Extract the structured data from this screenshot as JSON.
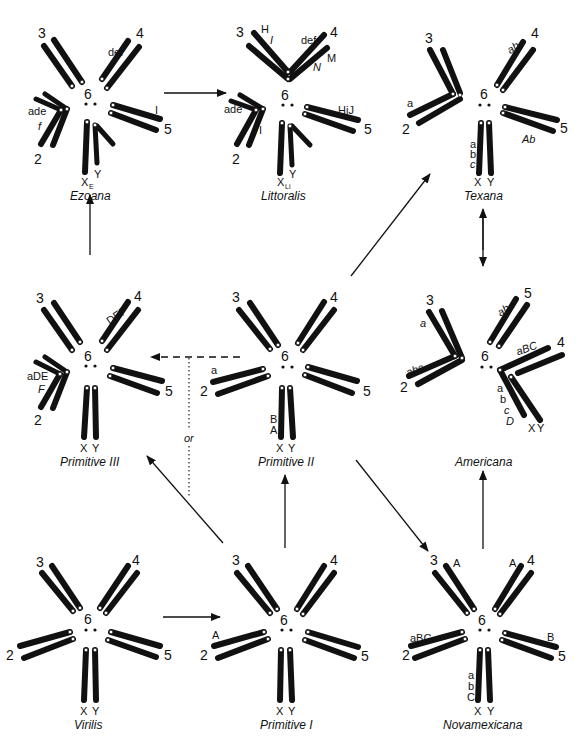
{
  "figure": {
    "type": "chromosome-karyotype-phylogeny",
    "chromosome_numbers": [
      "2",
      "3",
      "4",
      "5",
      "6"
    ],
    "sex_chromosomes": [
      "X",
      "Y"
    ],
    "or_label": "or"
  },
  "species": [
    {
      "id": "ezoana",
      "name": "Ezoana",
      "x_label": "X",
      "x_subscript": "E",
      "y_label": "Y",
      "labels": {
        "chr4": "def",
        "chr2": "ade",
        "chr2_italic": "f",
        "chr5": "I"
      }
    },
    {
      "id": "littoralis",
      "name": "Littoralis",
      "x_label": "X",
      "x_subscript": "Li",
      "y_label": "Y",
      "labels": {
        "chr3": "H",
        "chr3_italic": "I",
        "chr4": "def",
        "chr4_italic": "N",
        "chr4_upper": "M",
        "chr2": "ade",
        "chr2_inner": "I",
        "chr5": "HiJ"
      }
    },
    {
      "id": "texana",
      "name": "Texana",
      "x_label": "X",
      "y_label": "Y",
      "labels": {
        "chr4": "ab",
        "chr2": "a",
        "chr5": "Ab",
        "chrX": [
          "a",
          "b",
          "c"
        ]
      }
    },
    {
      "id": "primitive-iii",
      "name": "Primitive III",
      "x_label": "X",
      "y_label": "Y",
      "labels": {
        "chr4": "DEF",
        "chr2": "aDE",
        "chr2_italic": "F"
      }
    },
    {
      "id": "primitive-ii",
      "name": "Primitive II",
      "x_label": "X",
      "y_label": "Y",
      "labels": {
        "chr2": "a",
        "chrX": [
          "B",
          "A"
        ]
      }
    },
    {
      "id": "americana",
      "name": "Americana",
      "x_label": "X",
      "y_label": "Y",
      "labels": {
        "chr3": "a",
        "chr2": "abc",
        "chr5": "ab",
        "chr4": "aBC",
        "chrX": [
          "a",
          "b",
          "c",
          "D"
        ]
      }
    },
    {
      "id": "virilis",
      "name": "Virilis",
      "x_label": "X",
      "y_label": "Y",
      "labels": {}
    },
    {
      "id": "primitive-i",
      "name": "Primitive I",
      "x_label": "X",
      "y_label": "Y",
      "labels": {
        "chr2": "A"
      }
    },
    {
      "id": "novamexicana",
      "name": "Novamexicana",
      "x_label": "X",
      "y_label": "Y",
      "labels": {
        "chr3": "A",
        "chr4": "A",
        "chr2": "aBC",
        "chr5": "B",
        "chrX": [
          "a",
          "b",
          "C"
        ]
      }
    }
  ],
  "edges": [
    {
      "from": "Virilis",
      "to": "Primitive I",
      "style": "solid"
    },
    {
      "from": "Primitive I",
      "to": "Primitive II",
      "style": "solid"
    },
    {
      "from": "Primitive I",
      "to": "Primitive III",
      "style": "solid"
    },
    {
      "from": "Primitive II",
      "to": "Primitive III",
      "style": "dashed",
      "note": "or"
    },
    {
      "from": "Primitive II",
      "to": "Texana",
      "style": "solid"
    },
    {
      "from": "Primitive II",
      "to": "Novamexicana",
      "style": "solid"
    },
    {
      "from": "Primitive III",
      "to": "Ezoana",
      "style": "solid"
    },
    {
      "from": "Ezoana",
      "to": "Littoralis",
      "style": "solid"
    },
    {
      "from": "Texana",
      "to": "Americana",
      "style": "bidirectional"
    },
    {
      "from": "Novamexicana",
      "to": "Americana",
      "style": "solid"
    }
  ]
}
